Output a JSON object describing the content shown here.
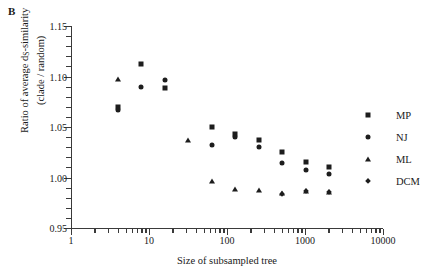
{
  "panel": {
    "letter": "B"
  },
  "axes": {
    "ylabel_line1": "Ratio of average d",
    "ylabel_sub": "S",
    "ylabel_line1b": "-similarity",
    "ylabel_line2": "(clade / random)",
    "xlabel": "Size of subsampled tree"
  },
  "legend": {
    "items": [
      {
        "label": "MP",
        "marker": "square"
      },
      {
        "label": "NJ",
        "marker": "circle"
      },
      {
        "label": "ML",
        "marker": "triangle"
      },
      {
        "label": "DCM",
        "marker": "diamond"
      }
    ]
  },
  "chart_data": {
    "type": "scatter",
    "title": "",
    "xlabel": "Size of subsampled tree",
    "ylabel": "Ratio of average dS-similarity (clade / random)",
    "xscale": "log",
    "yscale": "linear",
    "xlim": [
      1,
      10000
    ],
    "ylim": [
      0.95,
      1.15
    ],
    "xticks": [
      1,
      10,
      100,
      1000,
      10000
    ],
    "xtick_labels": [
      "1",
      "10",
      "100",
      "1000",
      "10000"
    ],
    "yticks": [
      0.95,
      1.0,
      1.05,
      1.1,
      1.15
    ],
    "ytick_labels": [
      "0.95",
      "1.00",
      "1.05",
      "1.10",
      "1.15"
    ],
    "grid": false,
    "legend_position": "right",
    "series": [
      {
        "name": "MP",
        "marker": "square",
        "color": "#1d1d1d",
        "points": [
          {
            "x": 4,
            "y": 1.07
          },
          {
            "x": 8,
            "y": 1.112
          },
          {
            "x": 16,
            "y": 1.089
          },
          {
            "x": 64,
            "y": 1.05
          },
          {
            "x": 128,
            "y": 1.043
          },
          {
            "x": 256,
            "y": 1.037
          },
          {
            "x": 512,
            "y": 1.025
          },
          {
            "x": 1024,
            "y": 1.015
          },
          {
            "x": 2048,
            "y": 1.01
          }
        ]
      },
      {
        "name": "NJ",
        "marker": "circle",
        "color": "#1d1d1d",
        "points": [
          {
            "x": 4,
            "y": 1.067
          },
          {
            "x": 8,
            "y": 1.09
          },
          {
            "x": 16,
            "y": 1.097
          },
          {
            "x": 64,
            "y": 1.032
          },
          {
            "x": 128,
            "y": 1.04
          },
          {
            "x": 256,
            "y": 1.03
          },
          {
            "x": 512,
            "y": 1.014
          },
          {
            "x": 1024,
            "y": 1.007
          },
          {
            "x": 2048,
            "y": 1.003
          }
        ]
      },
      {
        "name": "ML",
        "marker": "triangle",
        "color": "#1d1d1d",
        "points": [
          {
            "x": 4,
            "y": 1.098
          },
          {
            "x": 32,
            "y": 1.037
          },
          {
            "x": 64,
            "y": 0.997
          },
          {
            "x": 128,
            "y": 0.989
          },
          {
            "x": 256,
            "y": 0.988
          },
          {
            "x": 512,
            "y": 0.985
          },
          {
            "x": 1024,
            "y": 0.987
          },
          {
            "x": 2048,
            "y": 0.986
          }
        ]
      },
      {
        "name": "DCM",
        "marker": "diamond",
        "color": "#1d1d1d",
        "points": [
          {
            "x": 512,
            "y": 0.984
          },
          {
            "x": 1024,
            "y": 0.987
          },
          {
            "x": 2048,
            "y": 0.986
          }
        ]
      }
    ]
  }
}
